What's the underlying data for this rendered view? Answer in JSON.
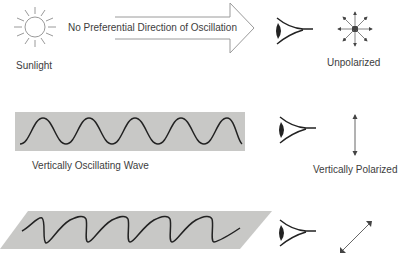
{
  "diagram": {
    "row1": {
      "source_label": "Sunlight",
      "arrow_label": "No Preferential Direction of Oscillation",
      "result_label": "Unpolarized",
      "source_icon": "sun-icon",
      "observer_icon": "eye-icon",
      "polarization_icon": "multi-direction-arrows-icon"
    },
    "row2": {
      "wave_label": "Vertically Oscillating Wave",
      "result_label": "Vertically Polarized",
      "observer_icon": "eye-icon",
      "polarization_icon": "vertical-double-arrow-icon"
    },
    "row3": {
      "observer_icon": "eye-icon",
      "polarization_icon": "diagonal-double-arrow-icon"
    },
    "colors": {
      "band_fill": "#c8c8c6",
      "stroke": "#2a2a2a",
      "light_stroke": "#8a8a8a",
      "text": "#3d3d3d"
    }
  }
}
